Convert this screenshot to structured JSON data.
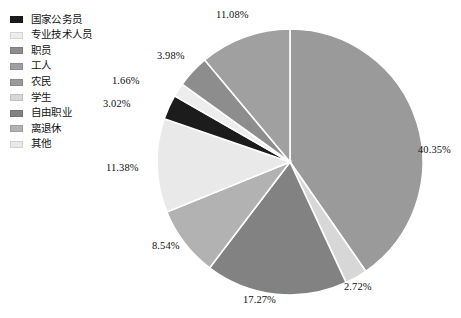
{
  "chart_data": {
    "type": "pie",
    "title": "",
    "legend_position": "left",
    "grid": false,
    "categories": [
      "国家公务员",
      "专业技术人员",
      "职员",
      "工人",
      "农民",
      "学生",
      "自由职业",
      "离退休",
      "其他"
    ],
    "values": [
      3.02,
      1.66,
      3.98,
      11.08,
      40.35,
      2.72,
      17.27,
      8.54,
      11.38
    ],
    "value_labels": [
      "3.02%",
      "1.66%",
      "3.98%",
      "11.08%",
      "40.35%",
      "2.72%",
      "17.27%",
      "8.54%",
      "11.38%"
    ],
    "unit": "%",
    "colors": [
      "#1c1c1c",
      "#ededed",
      "#8d8d8d",
      "#a0a0a0",
      "#9a9a9a",
      "#d7d7d7",
      "#828282",
      "#b2b2b2",
      "#e9e9e9"
    ],
    "slice_order_clockwise_from_top": [
      "农民",
      "学生",
      "自由职业",
      "离退休",
      "其他",
      "国家公务员",
      "专业技术人员",
      "职员",
      "工人"
    ]
  },
  "legend": {
    "items": [
      {
        "label": "国家公务员",
        "color": "#1c1c1c"
      },
      {
        "label": "专业技术人员",
        "color": "#ededed"
      },
      {
        "label": "职员",
        "color": "#8d8d8d"
      },
      {
        "label": "工人",
        "color": "#a0a0a0"
      },
      {
        "label": "农民",
        "color": "#9a9a9a"
      },
      {
        "label": "学生",
        "color": "#d7d7d7"
      },
      {
        "label": "自由职业",
        "color": "#828282"
      },
      {
        "label": "离退休",
        "color": "#b2b2b2"
      },
      {
        "label": "其他",
        "color": "#e9e9e9"
      }
    ]
  },
  "callouts": [
    {
      "text": "11.08%",
      "x": 216,
      "y": 10
    },
    {
      "text": "40.35%",
      "x": 418,
      "y": 145
    },
    {
      "text": "2.72%",
      "x": 344,
      "y": 282
    },
    {
      "text": "17.27%",
      "x": 243,
      "y": 295
    },
    {
      "text": "8.54%",
      "x": 152,
      "y": 241
    },
    {
      "text": "11.38%",
      "x": 106,
      "y": 163
    },
    {
      "text": "3.02%",
      "x": 103,
      "y": 99
    },
    {
      "text": "1.66%",
      "x": 112,
      "y": 76
    },
    {
      "text": "3.98%",
      "x": 157,
      "y": 51
    }
  ],
  "style": {
    "background": "#ffffff",
    "slice_border": "#ffffff",
    "text_color": "#101010"
  }
}
